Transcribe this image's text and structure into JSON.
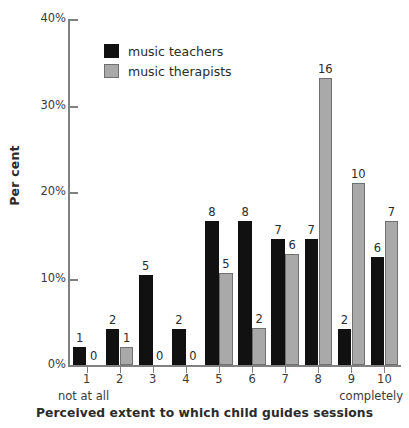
{
  "chart_data": {
    "type": "bar",
    "title": "",
    "xlabel": "Perceived extent to which child guides sessions",
    "ylabel": "Per cent",
    "categories": [
      "1",
      "2",
      "3",
      "4",
      "5",
      "6",
      "7",
      "8",
      "9",
      "10"
    ],
    "x_anchor_low": "not at all",
    "x_anchor_high": "completely",
    "ylim": [
      0,
      40
    ],
    "y_ticks": [
      "0%",
      "10%",
      "20%",
      "30%",
      "40%"
    ],
    "y_tick_values": [
      0,
      10,
      20,
      30,
      40
    ],
    "grid": false,
    "legend_position": "top-left-inside",
    "series": [
      {
        "name": "music teachers",
        "color": "#111111",
        "counts": [
          1,
          2,
          5,
          2,
          8,
          8,
          7,
          7,
          2,
          6
        ],
        "values": [
          2.1,
          4.2,
          10.4,
          4.2,
          16.7,
          16.7,
          14.6,
          14.6,
          4.2,
          12.5
        ],
        "labels": [
          "1",
          "2",
          "5",
          "2",
          "8",
          "8",
          "7",
          "7",
          "2",
          "6"
        ]
      },
      {
        "name": "music therapists",
        "color": "#a9a9a9",
        "counts": [
          0,
          1,
          0,
          0,
          5,
          2,
          6,
          16,
          10,
          7
        ],
        "values": [
          0.0,
          2.1,
          0.0,
          0.0,
          10.6,
          4.3,
          12.8,
          33.2,
          21.0,
          16.7
        ],
        "labels": [
          "0",
          "1",
          "0",
          "0",
          "5",
          "2",
          "6",
          "16",
          "10",
          "7"
        ]
      }
    ]
  },
  "legend": {
    "items": [
      {
        "label": "music teachers"
      },
      {
        "label": "music therapists"
      }
    ]
  }
}
